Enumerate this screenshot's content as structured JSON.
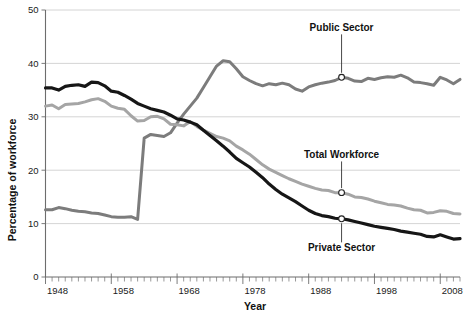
{
  "chart_data": {
    "type": "line",
    "title": "",
    "xlabel": "Year",
    "ylabel": "Percentage of workforce",
    "xlim": [
      1948,
      2011
    ],
    "ylim": [
      0,
      50
    ],
    "yticks": [
      0,
      10,
      20,
      30,
      40,
      50
    ],
    "ytick_labels": [
      "0",
      "10",
      "20",
      "30",
      "40",
      "50"
    ],
    "xticks": [
      1948,
      1958,
      1968,
      1978,
      1988,
      1998,
      2008
    ],
    "xtick_labels": [
      "1948",
      "1958",
      "1968",
      "1978",
      "1988",
      "1998",
      "2008"
    ],
    "minor_xtick_interval": 1,
    "grid": "horizontal",
    "legend_position": "inline-annotations",
    "x": [
      1948,
      1949,
      1950,
      1951,
      1952,
      1953,
      1954,
      1955,
      1956,
      1957,
      1958,
      1959,
      1960,
      1961,
      1962,
      1963,
      1964,
      1965,
      1966,
      1967,
      1968,
      1969,
      1970,
      1971,
      1972,
      1973,
      1974,
      1975,
      1976,
      1977,
      1978,
      1979,
      1980,
      1981,
      1982,
      1983,
      1984,
      1985,
      1986,
      1987,
      1988,
      1989,
      1990,
      1991,
      1992,
      1993,
      1994,
      1995,
      1996,
      1997,
      1998,
      1999,
      2000,
      2001,
      2002,
      2003,
      2004,
      2005,
      2006,
      2007,
      2008,
      2009,
      2010,
      2011
    ],
    "series": [
      {
        "name": "Public Sector",
        "color": "#7c7c7c",
        "linewidth": 3.0,
        "values": [
          12.6,
          12.6,
          13.0,
          12.8,
          12.5,
          12.3,
          12.2,
          12.0,
          11.9,
          11.6,
          11.3,
          11.2,
          11.2,
          11.3,
          10.8,
          26.0,
          26.7,
          26.5,
          26.3,
          27.0,
          28.8,
          30.5,
          32.0,
          33.5,
          35.5,
          37.5,
          39.5,
          40.5,
          40.3,
          39.0,
          37.5,
          36.8,
          36.2,
          35.8,
          36.2,
          36.0,
          36.3,
          36.0,
          35.2,
          34.8,
          35.6,
          36.0,
          36.3,
          36.5,
          36.8,
          37.4,
          37.2,
          36.7,
          36.6,
          37.2,
          37.0,
          37.3,
          37.5,
          37.4,
          37.8,
          37.3,
          36.5,
          36.4,
          36.2,
          35.9,
          37.4,
          36.9,
          36.2,
          37.0
        ]
      },
      {
        "name": "Total Workforce",
        "color": "#a5a5a5",
        "linewidth": 3.0,
        "values": [
          32.0,
          32.2,
          31.5,
          32.3,
          32.4,
          32.5,
          32.8,
          33.2,
          33.4,
          32.9,
          32.0,
          31.6,
          31.4,
          30.2,
          29.2,
          29.3,
          30.0,
          30.1,
          29.6,
          28.6,
          28.5,
          28.3,
          29.1,
          28.2,
          27.5,
          26.9,
          26.3,
          26.0,
          25.5,
          24.5,
          23.8,
          23.0,
          22.0,
          21.0,
          20.2,
          19.6,
          19.0,
          18.4,
          17.9,
          17.4,
          17.0,
          16.6,
          16.3,
          16.2,
          15.8,
          15.8,
          15.5,
          15.0,
          14.9,
          14.6,
          14.2,
          13.9,
          13.6,
          13.5,
          13.3,
          12.9,
          12.6,
          12.5,
          12.0,
          12.1,
          12.4,
          12.3,
          11.9,
          11.8
        ]
      },
      {
        "name": "Private Sector",
        "color": "#161616",
        "linewidth": 3.2,
        "values": [
          35.4,
          35.4,
          35.0,
          35.7,
          35.9,
          36.0,
          35.7,
          36.5,
          36.4,
          35.8,
          34.8,
          34.6,
          34.0,
          33.3,
          32.5,
          32.0,
          31.5,
          31.2,
          30.9,
          30.3,
          29.6,
          29.4,
          29.0,
          28.5,
          27.5,
          26.5,
          25.5,
          24.5,
          23.4,
          22.2,
          21.4,
          20.6,
          19.6,
          18.6,
          17.4,
          16.4,
          15.5,
          14.8,
          14.1,
          13.3,
          12.5,
          11.9,
          11.5,
          11.3,
          11.0,
          10.9,
          10.7,
          10.4,
          10.1,
          9.8,
          9.5,
          9.3,
          9.1,
          8.9,
          8.6,
          8.4,
          8.2,
          8.0,
          7.6,
          7.5,
          7.9,
          7.5,
          7.1,
          7.2
        ]
      }
    ],
    "annotations": [
      {
        "label": "Public Sector",
        "series": "Public Sector",
        "x": 1993,
        "y": 37.4,
        "label_x": 1993,
        "label_y": 46.0,
        "marker": "open-circle"
      },
      {
        "label": "Total Workforce",
        "series": "Total Workforce",
        "x": 1993,
        "y": 15.8,
        "label_x": 1993,
        "label_y": 22.2,
        "marker": "open-circle"
      },
      {
        "label": "Private Sector",
        "series": "Private Sector",
        "x": 1993,
        "y": 10.9,
        "label_x": 1993,
        "label_y": 4.8,
        "marker": "open-circle"
      }
    ],
    "colors": {
      "public_sector": "#7c7c7c",
      "total_workforce": "#a5a5a5",
      "private_sector": "#161616",
      "gridline": "#c9c9c9",
      "axis": "#6d6d6d",
      "text": "#111111",
      "background": "#ffffff"
    }
  }
}
